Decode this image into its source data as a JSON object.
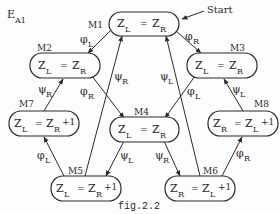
{
  "diagram": {
    "title": {
      "main": "E",
      "sub": "A1"
    },
    "caption": "fig.2.2",
    "start_label": "Start",
    "colors": {
      "ink": "#2a2a2a",
      "background": "#fdfdfd"
    },
    "nodes": {
      "M1": {
        "label": "M1",
        "lhs": "Z",
        "lhs_sub": "L",
        "op": "=",
        "rhs": "Z",
        "rhs_sub": "R",
        "extra": ""
      },
      "M2": {
        "label": "M2",
        "lhs": "Z",
        "lhs_sub": "L",
        "op": "=",
        "rhs": "Z",
        "rhs_sub": "R",
        "extra": ""
      },
      "M3": {
        "label": "M3",
        "lhs": "Z",
        "lhs_sub": "L",
        "op": "=",
        "rhs": "Z",
        "rhs_sub": "R",
        "extra": ""
      },
      "M4": {
        "label": "M4",
        "lhs": "Z",
        "lhs_sub": "L",
        "op": "=",
        "rhs": "Z",
        "rhs_sub": "R",
        "extra": ""
      },
      "M5": {
        "label": "M5",
        "lhs": "Z",
        "lhs_sub": "L",
        "op": "=",
        "rhs": "Z",
        "rhs_sub": "R",
        "extra": "+1"
      },
      "M6": {
        "label": "M6",
        "lhs": "Z",
        "lhs_sub": "R",
        "op": "=",
        "rhs": "Z",
        "rhs_sub": "L",
        "extra": "+1"
      },
      "M7": {
        "label": "M7",
        "lhs": "Z",
        "lhs_sub": "L",
        "op": "=",
        "rhs": "Z",
        "rhs_sub": "R",
        "extra": "+1"
      },
      "M8": {
        "label": "M8",
        "lhs": "Z",
        "lhs_sub": "R",
        "op": "=",
        "rhs": "Z",
        "rhs_sub": "L",
        "extra": "+1"
      }
    },
    "edges": [
      {
        "from": "M1",
        "to": "M2",
        "sym": "φ",
        "sub": "L"
      },
      {
        "from": "M1",
        "to": "M3",
        "sym": "φ",
        "sub": "R"
      },
      {
        "from": "M5",
        "to": "M1",
        "sym": "ψ",
        "sub": "R"
      },
      {
        "from": "M6",
        "to": "M1",
        "sym": "ψ",
        "sub": "L"
      },
      {
        "from": "M2",
        "to": "M4",
        "sym": "φ",
        "sub": "R"
      },
      {
        "from": "M3",
        "to": "M4",
        "sym": "φ",
        "sub": "L"
      },
      {
        "from": "M7",
        "to": "M2",
        "sym": "ψ",
        "sub": "R"
      },
      {
        "from": "M8",
        "to": "M3",
        "sym": "ψ",
        "sub": "L"
      },
      {
        "from": "M5",
        "to": "M7",
        "sym": "φ",
        "sub": "L"
      },
      {
        "from": "M6",
        "to": "M8",
        "sym": "φ",
        "sub": "R"
      },
      {
        "from": "M4",
        "to": "M5",
        "sym": "ψ",
        "sub": "L"
      },
      {
        "from": "M4",
        "to": "M6",
        "sym": "ψ",
        "sub": "R"
      }
    ]
  }
}
